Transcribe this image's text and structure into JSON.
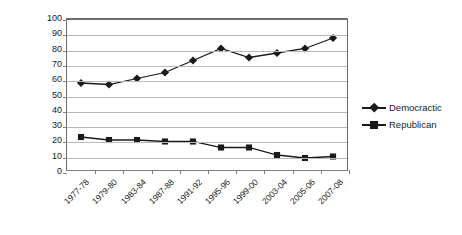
{
  "chart_data": {
    "type": "line",
    "title": "",
    "xlabel": "",
    "ylabel": "% Pro- Choice Vote",
    "categories": [
      "1977-78",
      "1979-80",
      "1983-84",
      "1987-88",
      "1991-92",
      "1995-96",
      "1999-00",
      "2003-04",
      "2005-06",
      "2007-08"
    ],
    "series": [
      {
        "name": "Democractic",
        "marker": "diamond",
        "color": "#1a1a1a",
        "values": [
          58,
          57,
          61,
          65,
          73,
          81,
          75,
          78,
          81,
          88
        ]
      },
      {
        "name": "Republican",
        "marker": "square",
        "color": "#1a1a1a",
        "values": [
          22,
          20,
          20,
          19,
          19,
          15,
          15,
          10,
          8,
          9
        ]
      }
    ],
    "ylim": [
      0,
      100
    ],
    "ytick_step": 10,
    "yticks": [
      "0",
      "10",
      "20",
      "30",
      "40",
      "50",
      "60",
      "70",
      "80",
      "90",
      "100"
    ],
    "grid": "horizontal",
    "legend_position": "right"
  },
  "legend": {
    "items": [
      {
        "label": "Democractic"
      },
      {
        "label": "Republican"
      }
    ]
  }
}
